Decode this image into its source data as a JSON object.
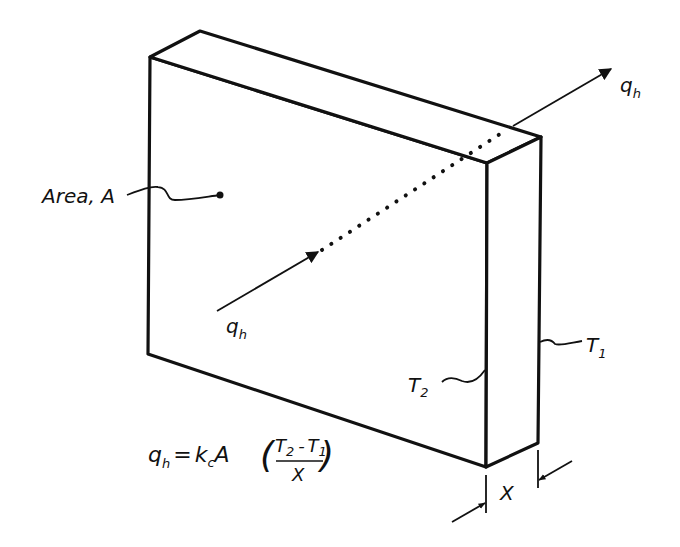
{
  "figure": {
    "colors": {
      "ink": "#111111",
      "background": "#ffffff"
    }
  },
  "labels": {
    "area": "Area, A",
    "heat_in": {
      "main": "q",
      "sub": "h"
    },
    "heat_out": {
      "main": "q",
      "sub": "h"
    },
    "t_hot": {
      "main": "T",
      "sub": "2"
    },
    "t_cold": {
      "main": "T",
      "sub": "1"
    },
    "thickness": "X"
  },
  "equation": {
    "lhs_main": "q",
    "lhs_sub": "h",
    "equals": "=",
    "k_main": "k",
    "k_sub": "c",
    "area": "A",
    "paren_open": "(",
    "num_t2_main": "T",
    "num_t2_sub": "2",
    "minus": "-",
    "num_t1_main": "T",
    "num_t1_sub": "1",
    "denominator": "X",
    "paren_close": ")"
  }
}
